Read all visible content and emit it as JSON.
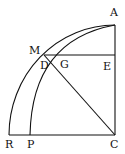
{
  "diagram": {
    "type": "geometric-construction",
    "labels": {
      "A": "A",
      "M": "M",
      "D": "D",
      "G": "G",
      "E": "E",
      "R": "R",
      "P": "P",
      "C": "C"
    },
    "stroke_color": "#111111",
    "background": "#ffffff"
  }
}
